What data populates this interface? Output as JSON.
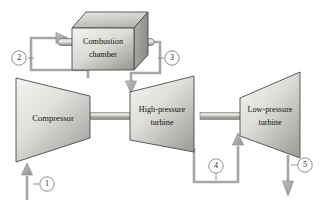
{
  "diagram": {
    "background_color": "#ffffff",
    "outline_color": "#4c4a47",
    "pipe_color": "#a8a6a3",
    "body_fill_light": "#f0f0ee",
    "body_fill_dark": "#9e9c99",
    "label_color": "#14110f"
  },
  "components": {
    "compressor": {
      "label": "Compressor",
      "shape": "trapezoid-narrowing-right"
    },
    "combustion_chamber": {
      "label_line1": "Combustion",
      "label_line2": "chamber",
      "shape": "isometric-box"
    },
    "hp_turbine": {
      "label_line1": "High-pressure",
      "label_line2": "turbine",
      "shape": "trapezoid-widening-right"
    },
    "lp_turbine": {
      "label_line1": "Low-pressure",
      "label_line2": "turbine",
      "shape": "trapezoid-widening-right"
    }
  },
  "state_points": [
    {
      "id": "1",
      "label": "1",
      "cx": 47,
      "cy": 184,
      "description": "compressor inlet"
    },
    {
      "id": "2",
      "label": "2",
      "cx": 19,
      "cy": 58,
      "description": "compressor exit to combustion chamber"
    },
    {
      "id": "3",
      "label": "3",
      "cx": 172,
      "cy": 58,
      "description": "combustion chamber exit to high-pressure turbine"
    },
    {
      "id": "4",
      "label": "4",
      "cx": 216,
      "cy": 166,
      "description": "high-pressure turbine exit to low-pressure turbine"
    },
    {
      "id": "5",
      "label": "5",
      "cx": 305,
      "cy": 165,
      "description": "low-pressure turbine exhaust"
    }
  ],
  "flow_arrows": [
    {
      "name": "inlet-arrow",
      "direction": "up",
      "at_state": "1"
    },
    {
      "name": "combustor-inlet-arrow",
      "direction": "right",
      "at_state": "2"
    },
    {
      "name": "combustor-outlet-arrow",
      "direction": "down",
      "at_state": "3"
    },
    {
      "name": "lp-turbine-inlet-arrow",
      "direction": "up",
      "at_state": "4"
    },
    {
      "name": "exhaust-arrow",
      "direction": "down",
      "at_state": "5"
    }
  ],
  "shafts": [
    {
      "name": "compressor-hp-turbine-shaft"
    },
    {
      "name": "hp-lp-turbine-shaft"
    }
  ]
}
